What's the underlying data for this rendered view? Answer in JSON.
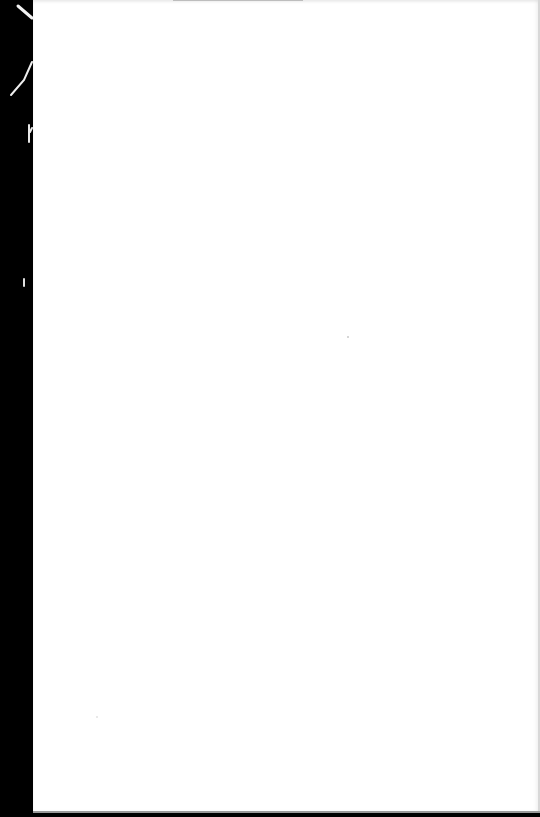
{
  "document": {
    "type": "scanned-page",
    "content": "",
    "is_blank": true
  },
  "colors": {
    "page": "#ffffff",
    "binding_edge": "#000000"
  }
}
